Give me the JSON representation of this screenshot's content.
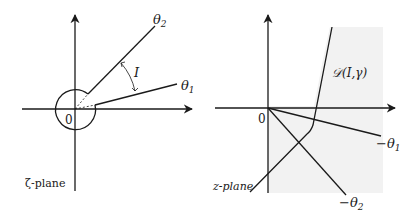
{
  "left_panel": {
    "plane_label": "ζ-plane",
    "origin_label": "0",
    "ray_upper_label": "θ",
    "ray_upper_sub": "2",
    "ray_lower_label": "θ",
    "ray_lower_sub": "1",
    "angle_label": "I"
  },
  "right_panel": {
    "plane_label": "z-plane",
    "origin_label": "0",
    "ray_upper_label": "−θ",
    "ray_upper_sub": "1",
    "ray_lower_label": "−θ",
    "ray_lower_sub": "2",
    "region_label": "𝒟(I,γ)"
  },
  "colors": {
    "stroke": "#1a1a1a",
    "region_fill": "#f2f2f2"
  }
}
